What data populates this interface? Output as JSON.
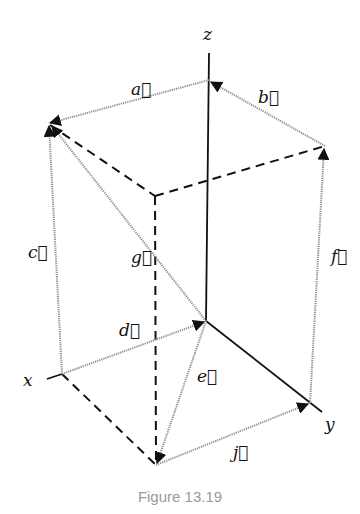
{
  "figure": {
    "caption": "Figure 13.19",
    "axes": {
      "x_label": "x",
      "y_label": "y",
      "z_label": "z"
    },
    "vectors": [
      {
        "name": "a",
        "label": "a⃗",
        "from": "z-point",
        "to": "top-left corner (x+z)"
      },
      {
        "name": "b",
        "label": "b⃗",
        "from": "top-right corner (y+z)",
        "to": "z-point"
      },
      {
        "name": "c",
        "label": "c⃗",
        "from": "x-point",
        "to": "top-left corner (x+z)"
      },
      {
        "name": "d",
        "label": "d⃗",
        "from": "x-point",
        "to": "origin"
      },
      {
        "name": "e",
        "label": "e⃗",
        "from": "origin",
        "to": "bottom corner (x+y)"
      },
      {
        "name": "f",
        "label": "f⃗",
        "from": "y-point",
        "to": "top-right corner (y+z)"
      },
      {
        "name": "g",
        "label": "g⃗",
        "from": "origin",
        "to": "top-left corner (x+z)"
      },
      {
        "name": "j",
        "label": "j⃗",
        "from": "bottom corner (x+y)",
        "to": "y-point"
      }
    ],
    "colors": {
      "axis": "#111111",
      "vector": "#8c8c8c",
      "dashed_edge": "#111111",
      "caption": "#9a9a9a"
    }
  }
}
